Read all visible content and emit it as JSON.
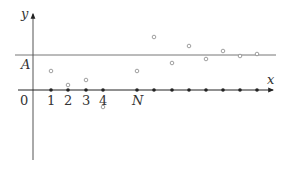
{
  "diagram": {
    "axes": {
      "y_label": "y",
      "x_label": "x",
      "origin_label": "0",
      "limit_label": "A",
      "x_tick_labels": [
        "1",
        "2",
        "3",
        "4",
        "N"
      ]
    },
    "colors": {
      "axis": "#333333",
      "limit_line": "#777777",
      "filled_point": "#222222",
      "open_point": "#888888",
      "label": "#333333"
    },
    "filled_points_x": [
      51,
      68,
      86,
      103,
      137,
      154,
      172,
      189,
      206,
      223,
      240,
      257
    ],
    "open_points": [
      {
        "x": 51,
        "y": 71
      },
      {
        "x": 68,
        "y": 85
      },
      {
        "x": 86,
        "y": 80
      },
      {
        "x": 103,
        "y": 107
      },
      {
        "x": 137,
        "y": 71
      },
      {
        "x": 154,
        "y": 37
      },
      {
        "x": 172,
        "y": 63
      },
      {
        "x": 189,
        "y": 46
      },
      {
        "x": 206,
        "y": 59
      },
      {
        "x": 223,
        "y": 51
      },
      {
        "x": 240,
        "y": 56
      },
      {
        "x": 257,
        "y": 54
      }
    ]
  }
}
